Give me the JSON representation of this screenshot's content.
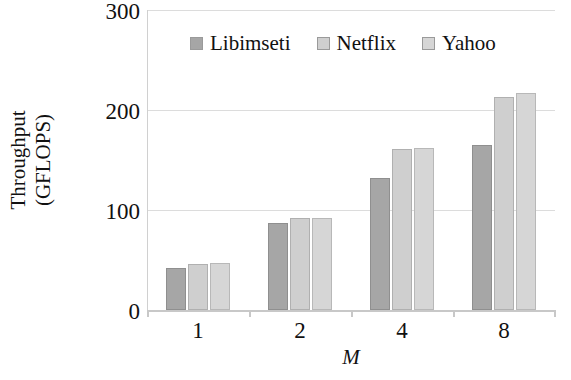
{
  "chart_data": {
    "type": "bar",
    "title": "",
    "categories": [
      "1",
      "2",
      "4",
      "8"
    ],
    "series": [
      {
        "name": "Libimseti",
        "values": [
          42,
          87,
          132,
          165
        ],
        "color": "#a6a6a6"
      },
      {
        "name": "Netflix",
        "values": [
          46,
          92,
          161,
          213
        ],
        "color": "#cfcfcf"
      },
      {
        "name": "Yahoo",
        "values": [
          47,
          92,
          162,
          217
        ],
        "color": "#d6d6d6"
      }
    ],
    "xlabel": "M",
    "ylabel_line1": "Throughput",
    "ylabel_line2": "(GFLOPS)",
    "ylim": [
      0,
      300
    ],
    "yticks": [
      300,
      200,
      100,
      0
    ],
    "ytick_labels": [
      "300",
      "200",
      "100",
      "0"
    ],
    "grid": true,
    "gridlines": [
      100,
      200,
      300
    ],
    "legend_position": "top-center",
    "legend_entries": [
      "Libimseti",
      "Netflix",
      "Yahoo"
    ]
  }
}
